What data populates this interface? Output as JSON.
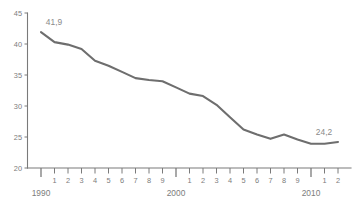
{
  "chart_data": {
    "type": "line",
    "title": "",
    "subtitle": "",
    "xlabel": "",
    "ylabel": "",
    "grid": false,
    "legend": null,
    "ylim": [
      20,
      45
    ],
    "yticks": [
      20,
      25,
      30,
      35,
      40,
      45
    ],
    "ytick_labels": [
      "20",
      "25",
      "30",
      "35",
      "40",
      "45"
    ],
    "x": [
      1990,
      1991,
      1992,
      1993,
      1994,
      1995,
      1996,
      1997,
      1998,
      1999,
      2000,
      2001,
      2002,
      2003,
      2004,
      2005,
      2006,
      2007,
      2008,
      2009,
      2010,
      2011,
      2012
    ],
    "xtick_labels": [
      "1990",
      "1",
      "2",
      "3",
      "4",
      "5",
      "6",
      "7",
      "8",
      "9",
      "2000",
      "1",
      "2",
      "3",
      "4",
      "5",
      "6",
      "7",
      "8",
      "9",
      "2010",
      "1",
      "2"
    ],
    "major_xtick_labels": [
      "1990",
      "2000",
      "2010"
    ],
    "major_xtick_indices": [
      0,
      10,
      20
    ],
    "values": [
      41.9,
      40.3,
      39.9,
      39.2,
      37.3,
      36.5,
      35.5,
      34.5,
      34.2,
      34.0,
      33.0,
      32.0,
      31.6,
      30.2,
      28.2,
      26.2,
      25.4,
      24.7,
      25.4,
      24.6,
      23.9,
      23.9,
      24.2
    ],
    "annotations": [
      {
        "name": "first-point-label",
        "text": "41,9",
        "x_index": 0,
        "value": 41.9
      },
      {
        "name": "last-point-label",
        "text": "24,2",
        "x_index": 22,
        "value": 24.2
      }
    ],
    "colors": {
      "line": "#6e6e6e",
      "axis": "#7a7a7a",
      "text": "#7c7c7c",
      "annotation": "#8a8a8a",
      "background": "#ffffff"
    }
  }
}
